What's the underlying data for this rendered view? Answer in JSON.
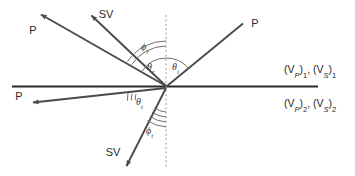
{
  "figure": {
    "background_color": "#ffffff",
    "line_color": "#4a4a4a",
    "interface_color": "#2b2b2b",
    "normal_color": "#8c8c8c",
    "text_color": "#2b2b2b"
  },
  "interface": {
    "name": "plane-interface",
    "y": 86,
    "x_start": 12,
    "x_end": 318
  },
  "normal": {
    "name": "normal-dashed-line",
    "x": 166,
    "y_start": 15,
    "y_end": 167
  },
  "origin": {
    "x": 166,
    "y": 87
  },
  "rays": [
    {
      "id": "incident-p",
      "label": "P",
      "kind": "incident",
      "wave_type": "P",
      "label_x": 250,
      "label_y": 31,
      "x1": 243,
      "y1": 23,
      "x2": 166,
      "y2": 87,
      "arrow_at": "none"
    },
    {
      "id": "reflected-p",
      "label": "P",
      "kind": "reflected",
      "wave_type": "P",
      "label_x": 33,
      "label_y": 30,
      "x1": 166,
      "y1": 87,
      "x2": 39,
      "y2": 13,
      "arrow_at": "end"
    },
    {
      "id": "reflected-sv",
      "label": "SV",
      "kind": "reflected",
      "wave_type": "SV",
      "label_x": 99,
      "label_y": 17,
      "x1": 166,
      "y1": 87,
      "x2": 90,
      "y2": 14,
      "arrow_at": "end"
    },
    {
      "id": "transmitted-p",
      "label": "P",
      "kind": "transmitted",
      "wave_type": "P",
      "label_x": 19,
      "label_y": 98,
      "x1": 166,
      "y1": 87,
      "x2": 31,
      "y2": 103,
      "arrow_at": "end"
    },
    {
      "id": "transmitted-sv",
      "label": "SV",
      "kind": "transmitted",
      "wave_type": "SV",
      "label_x": 110,
      "label_y": 155,
      "x1": 166,
      "y1": 87,
      "x2": 125,
      "y2": 168,
      "arrow_at": "end"
    }
  ],
  "angles": [
    {
      "id": "theta-i",
      "symbol": "θ",
      "subscript": "i",
      "meaning": "angle of incidence of P wave",
      "label_x": 173,
      "label_y": 69,
      "arcs": 1
    },
    {
      "id": "theta-r",
      "symbol": "θ",
      "subscript": "r",
      "meaning": "angle of reflection of P wave",
      "label_x": 148,
      "label_y": 69,
      "arcs": 1
    },
    {
      "id": "phi-r",
      "symbol": "ϕ",
      "subscript": "r",
      "meaning": "angle of reflection of SV wave",
      "label_x": 144,
      "label_y": 49,
      "arcs": 2
    },
    {
      "id": "theta-t",
      "symbol": "θ",
      "subscript": "t",
      "meaning": "angle of transmission of P wave",
      "label_x": 138,
      "label_y": 104,
      "arcs": 2
    },
    {
      "id": "phi-t",
      "symbol": "ϕ",
      "subscript": "t",
      "meaning": "angle of transmission of SV wave",
      "label_x": 148,
      "label_y": 133,
      "arcs": 3
    }
  ],
  "media": [
    {
      "id": "medium-upper",
      "p_velocity": "(V",
      "p_sub": "P",
      "p_close": ")",
      "p_index": "1",
      "s_velocity": "(V",
      "s_sub": "S",
      "s_close": ")",
      "s_index": "1",
      "full_text": "(V_P)_1, (V_S)_1",
      "x": 284,
      "y": 72
    },
    {
      "id": "medium-lower",
      "p_velocity": "(V",
      "p_sub": "P",
      "p_close": ")",
      "p_index": "2",
      "s_velocity": "(V",
      "s_sub": "S",
      "s_close": ")",
      "s_index": "2",
      "full_text": "(V_P)_2, (V_S)_2",
      "x": 284,
      "y": 106
    }
  ]
}
